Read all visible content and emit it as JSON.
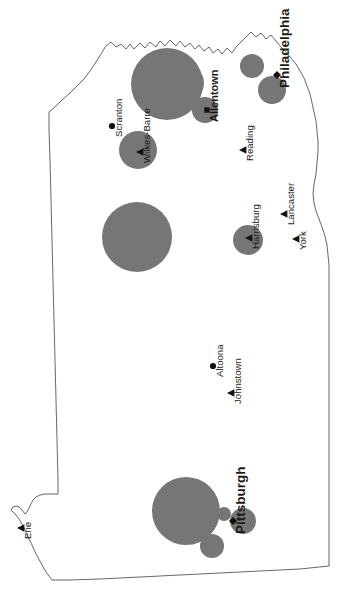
{
  "map": {
    "title": "Pennsylvania",
    "projection_note": "rotated",
    "background_color": "#ffffff",
    "outline_color": "#565656",
    "bubble_color": "#767676",
    "marker_color": "#111111",
    "label_color": "#1a1a1a",
    "rotation_degrees": -90
  },
  "chart_data": {
    "type": "scatter",
    "xlabel": "",
    "ylabel": "",
    "legend": [],
    "grid": false,
    "cities": [
      {
        "name": "Philadelphia",
        "label_class": "lbl-major",
        "marker": "diamond",
        "marker_x": 277,
        "marker_y": 75,
        "label_x": 285,
        "label_y": 88,
        "bubble_x": 272,
        "bubble_y": 90,
        "bubble_r": 14
      },
      {
        "name": "Pittsburgh",
        "label_class": "lbl-major",
        "marker": "diamond",
        "marker_x": 233,
        "marker_y": 521,
        "label_x": 241,
        "label_y": 534,
        "bubble_x": 186,
        "bubble_y": 511,
        "bubble_r": 34
      },
      {
        "name": "Allentown",
        "label_class": "lbl-mid",
        "marker": "square",
        "marker_x": 207,
        "marker_y": 110,
        "label_x": 215,
        "label_y": 122,
        "bubble_x": 205,
        "bubble_y": 110,
        "bubble_r": 13
      },
      {
        "name": "Harrisburg",
        "label_class": "lbl-minor",
        "marker": "triangle",
        "marker_x": 249,
        "marker_y": 238,
        "label_x": 256,
        "label_y": 249,
        "bubble_x": 248,
        "bubble_y": 240,
        "bubble_r": 15
      },
      {
        "name": "Scranton",
        "label_class": "lbl-minor",
        "marker": "circle",
        "marker_x": 112,
        "marker_y": 126,
        "label_x": 119,
        "label_y": 137,
        "bubble_x": null,
        "bubble_y": null,
        "bubble_r": 0
      },
      {
        "name": "Wilkes-Barre",
        "label_class": "lbl-minor",
        "marker": "triangle",
        "marker_x": 140,
        "marker_y": 152,
        "label_x": 147,
        "label_y": 163,
        "bubble_x": 138,
        "bubble_y": 150,
        "bubble_r": 19
      },
      {
        "name": "Reading",
        "label_class": "lbl-minor",
        "marker": "triangle",
        "marker_x": 243,
        "marker_y": 150,
        "label_x": 250,
        "label_y": 161,
        "bubble_x": null,
        "bubble_y": null,
        "bubble_r": 0
      },
      {
        "name": "Lancaster",
        "label_class": "lbl-minor",
        "marker": "triangle",
        "marker_x": 284,
        "marker_y": 214,
        "label_x": 291,
        "label_y": 225,
        "bubble_x": null,
        "bubble_y": null,
        "bubble_r": 0
      },
      {
        "name": "York",
        "label_class": "lbl-minor",
        "marker": "triangle",
        "marker_x": 296,
        "marker_y": 239,
        "label_x": 303,
        "label_y": 250,
        "bubble_x": null,
        "bubble_y": null,
        "bubble_r": 0
      },
      {
        "name": "Altoona",
        "label_class": "lbl-minor",
        "marker": "circle",
        "marker_x": 213,
        "marker_y": 366,
        "label_x": 220,
        "label_y": 377,
        "bubble_x": null,
        "bubble_y": null,
        "bubble_r": 0
      },
      {
        "name": "Johnstown",
        "label_class": "lbl-minor",
        "marker": "triangle",
        "marker_x": 231,
        "marker_y": 393,
        "label_x": 238,
        "label_y": 404,
        "bubble_x": null,
        "bubble_y": null,
        "bubble_r": 0
      },
      {
        "name": "Erie",
        "label_class": "lbl-minor",
        "marker": "triangle",
        "marker_x": 21,
        "marker_y": 528,
        "label_x": 28,
        "label_y": 539,
        "bubble_x": null,
        "bubble_y": null,
        "bubble_r": 0
      }
    ],
    "bubbles": [
      {
        "id": "bubble-ne-large",
        "x": 167,
        "y": 84,
        "r": 36,
        "clipped": true
      },
      {
        "id": "bubble-ne-secondary",
        "x": 186,
        "y": 83,
        "r": 18,
        "clipped": true
      },
      {
        "id": "bubble-north-small",
        "x": 252,
        "y": 66,
        "r": 12,
        "clipped": true
      },
      {
        "id": "bubble-allentown",
        "x": 205,
        "y": 110,
        "r": 13,
        "clipped": false
      },
      {
        "id": "bubble-philadelphia",
        "x": 272,
        "y": 90,
        "r": 14,
        "clipped": false
      },
      {
        "id": "bubble-wilkes-barre",
        "x": 138,
        "y": 150,
        "r": 19,
        "clipped": false
      },
      {
        "id": "bubble-central-large",
        "x": 137,
        "y": 237,
        "r": 35,
        "clipped": false
      },
      {
        "id": "bubble-harrisburg",
        "x": 248,
        "y": 240,
        "r": 15,
        "clipped": false
      },
      {
        "id": "bubble-pittsburgh-main",
        "x": 186,
        "y": 511,
        "r": 34,
        "clipped": false
      },
      {
        "id": "bubble-pittsburgh-s",
        "x": 212,
        "y": 546,
        "r": 12,
        "clipped": false
      },
      {
        "id": "bubble-pittsburgh-e1",
        "x": 224,
        "y": 514,
        "r": 7,
        "clipped": false
      },
      {
        "id": "bubble-pittsburgh-e2",
        "x": 243,
        "y": 521,
        "r": 13,
        "clipped": false
      }
    ]
  }
}
